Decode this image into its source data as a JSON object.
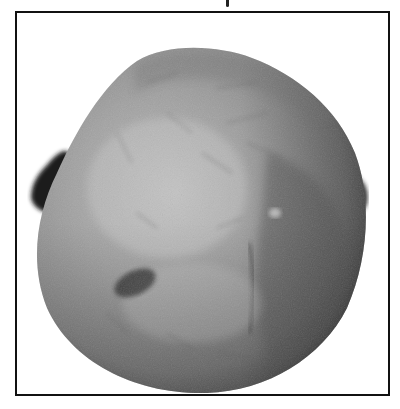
{
  "image": {
    "kind": "grayscale photograph",
    "subject": "rounded specimen in a bordered frame",
    "frame": {
      "border_color": "#111111",
      "background": "#ffffff"
    },
    "specimen": {
      "base_tone": "#9a9a9a",
      "highlight_tone": "#c4c4c4",
      "shadow_tone": "#4a4a4a",
      "attachment_tone": "#1a1a1a"
    }
  }
}
